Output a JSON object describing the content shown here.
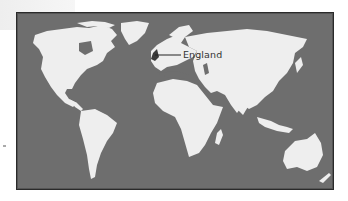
{
  "map": {
    "title": "World map",
    "callout": {
      "label": "England",
      "target": "England"
    },
    "colors": {
      "ocean": "#6e6e6e",
      "land": "#eeeeee",
      "border": "#2a2a2a",
      "highlight": "#3a3a3a"
    },
    "regions": [
      "North America",
      "Greenland",
      "South America",
      "Europe",
      "Africa",
      "Asia",
      "Australia",
      "New Zealand"
    ]
  }
}
